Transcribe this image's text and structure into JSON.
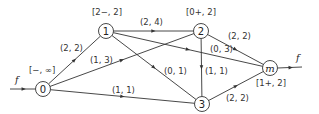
{
  "diagram": {
    "title": "",
    "nodes": [
      {
        "id": "0",
        "label": "0",
        "x": 43,
        "y": 89,
        "mark": "[−, ∞]",
        "mark_x": 29,
        "mark_y": 73
      },
      {
        "id": "1",
        "label": "1",
        "x": 106,
        "y": 31,
        "mark": "[2−, 2]",
        "mark_x": 92,
        "mark_y": 15
      },
      {
        "id": "2",
        "label": "2",
        "x": 201,
        "y": 31,
        "mark": "[0+, 2]",
        "mark_x": 186,
        "mark_y": 15
      },
      {
        "id": "3",
        "label": "3",
        "x": 202,
        "y": 104,
        "mark": "",
        "mark_x": 0,
        "mark_y": 0
      },
      {
        "id": "m",
        "label": "m",
        "x": 270,
        "y": 68,
        "mark": "[1+, 2]",
        "mark_x": 256,
        "mark_y": 86
      }
    ],
    "edges": [
      {
        "from": "0",
        "to": "1",
        "label": "(2, 2)",
        "lx": 60,
        "ly": 51
      },
      {
        "from": "0",
        "to": "2",
        "label": "(1, 3)",
        "lx": 90,
        "ly": 63
      },
      {
        "from": "0",
        "to": "3",
        "label": "(1, 1)",
        "lx": 112,
        "ly": 93
      },
      {
        "from": "1",
        "to": "2",
        "label": "(2, 4)",
        "lx": 140,
        "ly": 25
      },
      {
        "from": "1",
        "to": "3",
        "label": "(0, 1)",
        "lx": 164,
        "ly": 74
      },
      {
        "from": "1",
        "to": "m",
        "label": "(0, 3)",
        "lx": 210,
        "ly": 52
      },
      {
        "from": "2",
        "to": "m",
        "label": "(2, 2)",
        "lx": 228,
        "ly": 39
      },
      {
        "from": "2",
        "to": "3",
        "label": "(1, 1)",
        "lx": 205,
        "ly": 74
      },
      {
        "from": "3",
        "to": "m",
        "label": "(2, 2)",
        "lx": 226,
        "ly": 101
      }
    ],
    "flow_in": {
      "label": "f",
      "x1": 10,
      "y1": 89,
      "lx": 15,
      "ly": 83
    },
    "flow_out": {
      "label": "f",
      "x2": 302,
      "y2": 67,
      "lx": 296,
      "ly": 61
    }
  }
}
